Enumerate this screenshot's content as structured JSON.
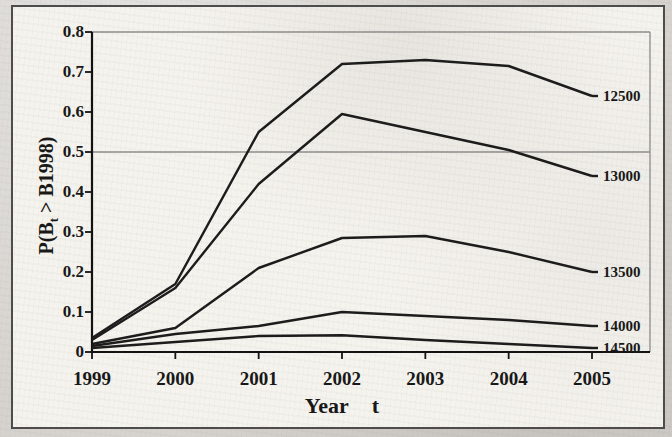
{
  "figure": {
    "paper_color": "#f5f3ee",
    "page_color": "#d6d3ce",
    "border_color": "#4c4c4c",
    "line_color": "#1b1b1b",
    "grid_color": "#8c8c8c",
    "axis_color": "#111111"
  },
  "chart_data": {
    "type": "line",
    "title": "",
    "xlabel": "Year t",
    "ylabel": "P(Bt > B1998)",
    "ylabel_parts": {
      "pre": "P(B",
      "sub": "t",
      "post": " > B1998)"
    },
    "x": [
      1999,
      2000,
      2001,
      2002,
      2003,
      2004,
      2005
    ],
    "x_tick_labels": [
      "1999",
      "2000",
      "2001",
      "2002",
      "2003",
      "2004",
      "2005"
    ],
    "y_ticks": [
      0,
      0.1,
      0.2,
      0.3,
      0.4,
      0.5,
      0.6,
      0.7,
      0.8
    ],
    "y_tick_labels": [
      "0",
      "0.1",
      "0.2",
      "0.3",
      "0.4",
      "0.5",
      "0.6",
      "0.7",
      "0.8"
    ],
    "ylim": [
      0,
      0.8
    ],
    "gridlines_y": [
      0.5,
      0.8
    ],
    "grid": "horizontal gridlines at 0.5 and 0.8 only",
    "legend_position": "labels at right end of each line",
    "series": [
      {
        "name": "12500",
        "values": [
          0.035,
          0.17,
          0.55,
          0.72,
          0.73,
          0.715,
          0.64
        ]
      },
      {
        "name": "13000",
        "values": [
          0.03,
          0.16,
          0.42,
          0.595,
          0.55,
          0.505,
          0.44
        ]
      },
      {
        "name": "13500",
        "values": [
          0.02,
          0.06,
          0.21,
          0.285,
          0.29,
          0.25,
          0.2
        ]
      },
      {
        "name": "14000",
        "values": [
          0.015,
          0.045,
          0.065,
          0.1,
          0.09,
          0.08,
          0.065
        ]
      },
      {
        "name": "14500",
        "values": [
          0.01,
          0.025,
          0.04,
          0.042,
          0.03,
          0.02,
          0.01
        ]
      }
    ]
  }
}
